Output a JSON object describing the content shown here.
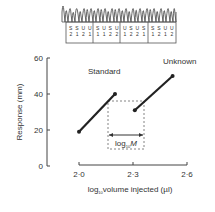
{
  "chart_data": {
    "type": "line",
    "title": "",
    "xlabel": "log10 volume injected (µl)",
    "xlabel_parts": {
      "pre": "log",
      "sub": "10",
      "post": "volume injected (µl)"
    },
    "ylabel": "Response (mm)",
    "xlim": [
      1.97,
      2.62
    ],
    "ylim": [
      0,
      60
    ],
    "x_ticks": [
      "2·0",
      "2·3",
      "2·6"
    ],
    "x_tick_values": [
      2.0,
      2.3,
      2.6
    ],
    "y_ticks": [
      "0",
      "20",
      "40",
      "60"
    ],
    "y_tick_values": [
      0,
      20,
      40,
      60
    ],
    "grid": false,
    "series": [
      {
        "name": "Standard",
        "x": [
          2.0,
          2.2
        ],
        "y": [
          19,
          40
        ]
      },
      {
        "name": "Unknown",
        "x": [
          2.31,
          2.52
        ],
        "y": [
          31,
          50
        ]
      }
    ],
    "annotations": {
      "standard_label": "Standard",
      "unknown_label": "Unknown",
      "log_m": {
        "pre": "log",
        "sub": "10",
        "post": "M"
      }
    },
    "trace_strip": {
      "groups": [
        {
          "labels": [
            "S",
            "S",
            "U",
            "U"
          ],
          "subs": [
            "2",
            "1",
            "2",
            "1"
          ]
        },
        {
          "labels": [
            "S",
            "U",
            "S",
            "U"
          ],
          "subs": [
            "1",
            "1",
            "2",
            "2"
          ]
        },
        {
          "labels": [
            "U",
            "S",
            "U",
            "S"
          ],
          "subs": [
            "1",
            "2",
            "2",
            "1"
          ]
        },
        {
          "labels": [
            "S",
            "S",
            "U",
            "U"
          ],
          "subs": [
            "1",
            "2",
            "1",
            "2"
          ]
        }
      ]
    }
  }
}
